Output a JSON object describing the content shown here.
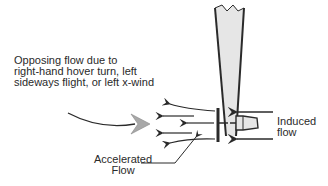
{
  "diagram": {
    "type": "tail-rotor airflow diagram",
    "labels": {
      "opposing_flow": "Opposing flow due to\nright-hand hover turn, left\nsideways flight, or left x-wind",
      "induced_flow": "Induced\nflow",
      "accelerated_flow": "Accelerated\nFlow"
    },
    "elements": [
      {
        "name": "tail-boom",
        "description": "tapered vertical tail boom with broken top edge"
      },
      {
        "name": "tail-rotor-disc",
        "description": "vertical rotor disc line at left of boom"
      },
      {
        "name": "gearbox-hub",
        "description": "tapered hub extending right"
      },
      {
        "name": "induced-flow-arrows",
        "count": 2,
        "direction": "left"
      },
      {
        "name": "accelerated-flow-arrows",
        "count": 5,
        "direction": "left"
      },
      {
        "name": "opposing-flow-arrow",
        "direction": "right",
        "style": "curved, gray arrowhead"
      }
    ],
    "colors": {
      "line": "#2a2a2a",
      "boom_fill": "#e6e6e6",
      "arrowhead_gray": "#a0a0a0"
    }
  }
}
